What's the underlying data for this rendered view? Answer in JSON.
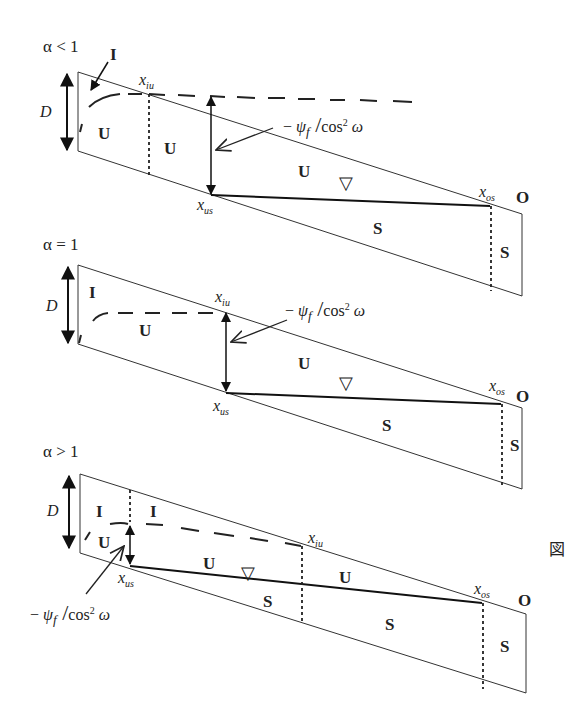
{
  "panels": [
    {
      "case_label": "α < 1",
      "depth_label": "D",
      "zone_labels": [
        "I",
        "U",
        "U",
        "U",
        "S",
        "S"
      ],
      "x_iu_label": "x",
      "x_iu_sub": "iu",
      "x_us_label": "x",
      "x_us_sub": "us",
      "x_os_label": "x",
      "x_os_sub": "os",
      "outlet_label": "O",
      "psi_prefix": "− ",
      "psi_symbol": "ψ",
      "psi_sub": "f",
      "psi_den": "cos",
      "psi_exp": "2",
      "psi_omega": "ω",
      "water_table_symbol": "▽"
    },
    {
      "case_label": "α = 1",
      "depth_label": "D",
      "zone_labels": [
        "I",
        "U",
        "U",
        "S",
        "S"
      ],
      "x_iu_label": "x",
      "x_iu_sub": "iu",
      "x_us_label": "x",
      "x_us_sub": "us",
      "x_os_label": "x",
      "x_os_sub": "os",
      "outlet_label": "O",
      "psi_prefix": "− ",
      "psi_symbol": "ψ",
      "psi_sub": "f",
      "psi_den": "cos",
      "psi_exp": "2",
      "psi_omega": "ω",
      "water_table_symbol": "▽"
    },
    {
      "case_label": "α > 1",
      "depth_label": "D",
      "zone_labels": [
        "I",
        "I",
        "U",
        "U",
        "U",
        "S",
        "S",
        "S"
      ],
      "x_iu_label": "x",
      "x_iu_sub": "iu",
      "x_us_label": "x",
      "x_us_sub": "us",
      "x_os_label": "x",
      "x_os_sub": "os",
      "outlet_label": "O",
      "psi_prefix": "− ",
      "psi_symbol": "ψ",
      "psi_sub": "f",
      "psi_den": "cos",
      "psi_exp": "2",
      "psi_omega": "ω",
      "water_table_symbol": "▽"
    }
  ],
  "side_mark": "図"
}
